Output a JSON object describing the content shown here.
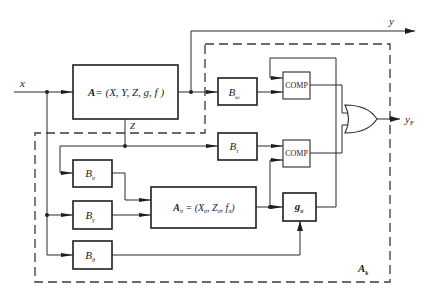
{
  "diagram": {
    "type": "block-diagram",
    "signals": {
      "input_x": "x",
      "output_y": "y",
      "output_yF": "y",
      "output_yF_sub": "F",
      "state_z": "Z"
    },
    "blocks": {
      "A": {
        "lhs": "A",
        "rhs": "= (X, Y, Z, g, f )"
      },
      "B_omega": {
        "base": "B",
        "sub": "ω"
      },
      "B_tau": {
        "base": "B",
        "sub": "τ"
      },
      "B_sigma": {
        "base": "B",
        "sub": "σ"
      },
      "B_gamma": {
        "base": "B",
        "sub": "γ"
      },
      "B_theta": {
        "base": "B",
        "sub": "θ"
      },
      "A_sigma": {
        "lhs": "A",
        "lhs_sub": "σ",
        "rhs_open": " = (X",
        "x_sub": "σ",
        "mid": ", Z",
        "z_sub": "σ",
        "f": ", f",
        "f_sub": "σ",
        "close": ")"
      },
      "g_sigma": {
        "base": "g",
        "sub": "σ"
      },
      "comp1": {
        "label": "COMP"
      },
      "comp2": {
        "label": "COMP"
      },
      "or_gate": {
        "label": "OR"
      }
    },
    "boundary": {
      "base": "A",
      "sub": "k",
      "style": "dashed"
    },
    "colors": {
      "line": "#2a2a2a",
      "background": "#ffffff"
    }
  }
}
